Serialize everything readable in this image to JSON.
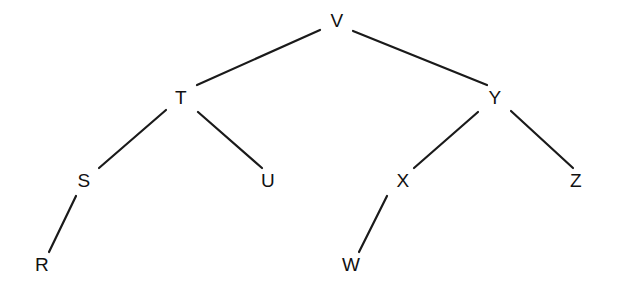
{
  "diagram": {
    "kind": "binary-tree",
    "background_color": "#ffffff",
    "edge_color": "#1a1a1a",
    "label_color": "#111111",
    "canvas": {
      "width": 617,
      "height": 295
    },
    "nodes": [
      {
        "id": "V",
        "label": "V",
        "x": 337,
        "y": 22,
        "level": 0,
        "parent": null
      },
      {
        "id": "T",
        "label": "T",
        "x": 181,
        "y": 99,
        "level": 1,
        "parent": "V",
        "side": "left"
      },
      {
        "id": "Y",
        "label": "Y",
        "x": 495,
        "y": 99,
        "level": 1,
        "parent": "V",
        "side": "right"
      },
      {
        "id": "S",
        "label": "S",
        "x": 84,
        "y": 182,
        "level": 2,
        "parent": "T",
        "side": "left"
      },
      {
        "id": "U",
        "label": "U",
        "x": 268,
        "y": 182,
        "level": 2,
        "parent": "T",
        "side": "right"
      },
      {
        "id": "X",
        "label": "X",
        "x": 403,
        "y": 182,
        "level": 2,
        "parent": "Y",
        "side": "left"
      },
      {
        "id": "Z",
        "label": "Z",
        "x": 576,
        "y": 182,
        "level": 2,
        "parent": "Y",
        "side": "right"
      },
      {
        "id": "R",
        "label": "R",
        "x": 42,
        "y": 266,
        "level": 3,
        "parent": "S",
        "side": "left"
      },
      {
        "id": "W",
        "label": "W",
        "x": 351,
        "y": 266,
        "level": 3,
        "parent": "X",
        "side": "left"
      }
    ],
    "edges": [
      {
        "id": "V-T",
        "from": "V",
        "to": "T",
        "x1": 320,
        "y1": 30,
        "x2": 197,
        "y2": 85
      },
      {
        "id": "V-Y",
        "from": "V",
        "to": "Y",
        "x1": 353,
        "y1": 31,
        "x2": 487,
        "y2": 85
      },
      {
        "id": "T-S",
        "from": "T",
        "to": "S",
        "x1": 166,
        "y1": 110,
        "x2": 99,
        "y2": 168
      },
      {
        "id": "T-U",
        "from": "T",
        "to": "U",
        "x1": 198,
        "y1": 112,
        "x2": 262,
        "y2": 168
      },
      {
        "id": "Y-X",
        "from": "Y",
        "to": "X",
        "x1": 478,
        "y1": 112,
        "x2": 414,
        "y2": 168
      },
      {
        "id": "Y-Z",
        "from": "Y",
        "to": "Z",
        "x1": 511,
        "y1": 111,
        "x2": 573,
        "y2": 168
      },
      {
        "id": "S-R",
        "from": "S",
        "to": "R",
        "x1": 76,
        "y1": 196,
        "x2": 49,
        "y2": 252
      },
      {
        "id": "X-W",
        "from": "X",
        "to": "W",
        "x1": 387,
        "y1": 196,
        "x2": 359,
        "y2": 252
      }
    ]
  }
}
